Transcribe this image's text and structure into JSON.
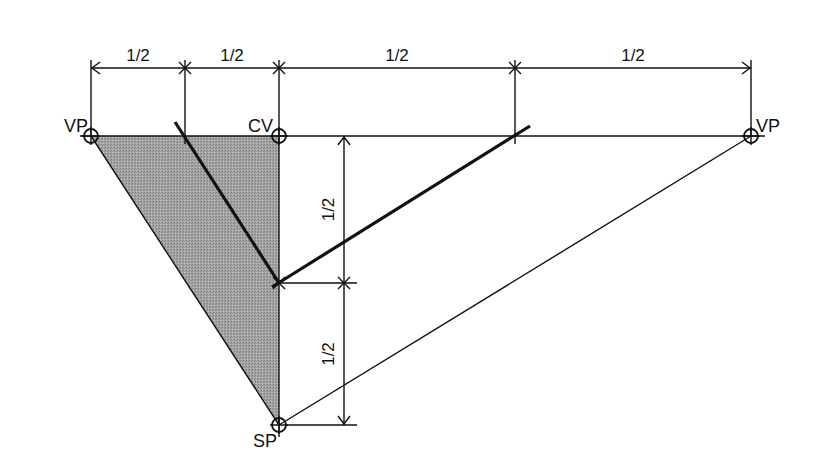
{
  "diagram": {
    "type": "two-point perspective construction",
    "colors": {
      "line": "#111111",
      "shade": "#9a9a9a",
      "background": "#ffffff"
    },
    "points": {
      "vp_left": {
        "label": "VP",
        "x": 91,
        "y": 136
      },
      "cv": {
        "label": "CV",
        "x": 279,
        "y": 136
      },
      "vp_right": {
        "label": "VP",
        "x": 751,
        "y": 136
      },
      "sp": {
        "label": "SP",
        "x": 279,
        "y": 425
      },
      "mid": {
        "x": 279,
        "y": 283
      }
    },
    "top_dimensions": {
      "y": 68,
      "ticks_x": [
        91,
        185,
        279,
        515,
        751
      ],
      "labels": [
        "1/2",
        "1/2",
        "1/2",
        "1/2"
      ]
    },
    "side_dimensions": {
      "x": 344,
      "ticks_y": [
        136,
        283,
        425
      ],
      "labels": [
        "1/2",
        "1/2"
      ]
    },
    "horizon_line": {
      "x1": 80,
      "x2": 765,
      "y": 136
    },
    "thick_lines": [
      {
        "x1": 175,
        "y1": 122,
        "x2": 279,
        "y2": 283
      },
      {
        "x1": 272,
        "y1": 287,
        "x2": 530,
        "y2": 126
      }
    ]
  }
}
